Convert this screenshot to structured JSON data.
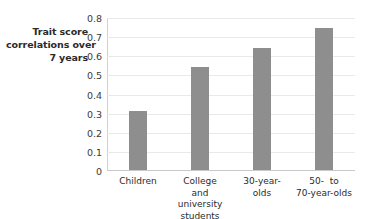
{
  "chart_data": {
    "type": "bar",
    "title": "",
    "xlabel": "",
    "ylabel": "Trait score correlations over 7 years",
    "ylabel_lines": [
      "Trait score",
      "correlations over",
      "7 years"
    ],
    "categories": [
      "Children",
      "College and university students",
      "30-year-olds",
      "50- to 70-year-olds"
    ],
    "category_lines": [
      [
        "Children"
      ],
      [
        "College",
        "and",
        "university",
        "students"
      ],
      [
        "30-year-",
        "olds"
      ],
      [
        "50-  to",
        "70-year-olds"
      ]
    ],
    "values": [
      0.31,
      0.54,
      0.64,
      0.74
    ],
    "ylim": [
      0,
      0.8
    ],
    "ytick_labels": [
      "0.8",
      "0.7",
      "0.6",
      "0.5",
      "0.4",
      "0.3",
      "0.2",
      "0.1",
      "0"
    ],
    "ytick_values": [
      0.8,
      0.7,
      0.6,
      0.5,
      0.4,
      0.3,
      0.2,
      0.1,
      0
    ],
    "grid": true,
    "legend": "none",
    "bar_color": "#8e8e8e",
    "gridline_color": "#e9e9e9",
    "axis_color": "#d2d2d2",
    "text_color": "#2b2b2b",
    "background_color": "#ffffff"
  }
}
